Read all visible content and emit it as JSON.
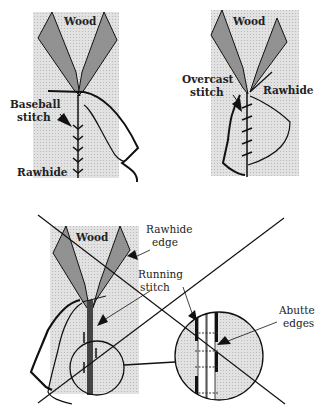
{
  "figure": {
    "panels": [
      {
        "id": "baseball",
        "labels": {
          "wood": "Wood",
          "stitch_line1": "Baseball",
          "stitch_line2": "stitch",
          "rawhide": "Rawhide"
        }
      },
      {
        "id": "overcast",
        "labels": {
          "wood": "Wood",
          "stitch_line1": "Overcast",
          "stitch_line2": "stitch",
          "rawhide": "Rawhide"
        }
      },
      {
        "id": "running",
        "labels": {
          "wood": "Wood",
          "rawhide_edge_line1": "Rawhide",
          "rawhide_edge_line2": "edge",
          "stitch_line1": "Running",
          "stitch_line2": "stitch",
          "abutte_line1": "Abutte",
          "abutte_line2": "edges"
        }
      }
    ],
    "colors": {
      "background": "#ffffff",
      "wood_backing": "#d9d9d9",
      "leaf_fill": "#8c8c8c",
      "ink": "#111111",
      "inset_fill": "#cfcfcf"
    }
  }
}
